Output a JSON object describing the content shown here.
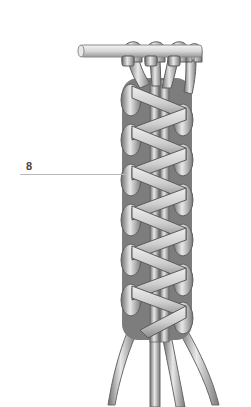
{
  "diagram": {
    "callout_label": "8",
    "colors": {
      "cord_light": "#e6e6e6",
      "cord_mid": "#a9a9a9",
      "cord_dark": "#6f6f6f",
      "rod": "#dcdcdc",
      "leader_line": "#b8b8b8"
    }
  }
}
